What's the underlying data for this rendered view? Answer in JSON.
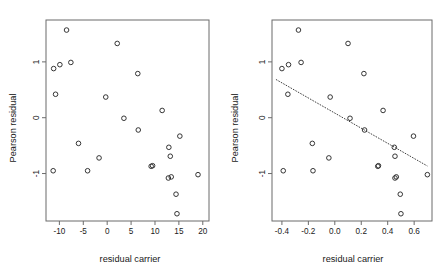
{
  "figure": {
    "background": "#ffffff",
    "point_color": "#2b2b2b",
    "frame_color": "#6b6b6b",
    "panel_count": 2
  },
  "chart_data": [
    {
      "type": "scatter",
      "panel": "left",
      "title": "",
      "xlabel": "residual carrier",
      "ylabel": "Pearson residual",
      "xticks": [
        "-10",
        "-5",
        "0",
        "5",
        "10",
        "15",
        "20"
      ],
      "xtick_values": [
        -10,
        -5,
        0,
        5,
        10,
        15,
        20
      ],
      "yticks": [
        "1",
        "0",
        "-1"
      ],
      "ytick_values": [
        1,
        0,
        -1
      ],
      "xlim": [
        -12.8,
        21.3
      ],
      "ylim": [
        -1.85,
        1.75
      ],
      "grid": false,
      "legend": "none",
      "marker": "open-circle",
      "points": [
        {
          "x": -11.3,
          "y": -0.95
        },
        {
          "x": -11.2,
          "y": 0.88
        },
        {
          "x": -10.8,
          "y": 0.42
        },
        {
          "x": -9.9,
          "y": 0.95
        },
        {
          "x": -8.5,
          "y": 1.57
        },
        {
          "x": -7.6,
          "y": 0.99
        },
        {
          "x": -6.0,
          "y": -0.46
        },
        {
          "x": -4.1,
          "y": -0.95
        },
        {
          "x": -1.7,
          "y": -0.72
        },
        {
          "x": -0.3,
          "y": 0.37
        },
        {
          "x": 2.1,
          "y": 1.33
        },
        {
          "x": 3.5,
          "y": -0.01
        },
        {
          "x": 6.4,
          "y": 0.79
        },
        {
          "x": 6.5,
          "y": -0.22
        },
        {
          "x": 9.2,
          "y": -0.87
        },
        {
          "x": 9.5,
          "y": -0.86
        },
        {
          "x": 11.5,
          "y": 0.13
        },
        {
          "x": 12.9,
          "y": -0.53
        },
        {
          "x": 12.8,
          "y": -1.08
        },
        {
          "x": 13.4,
          "y": -1.06
        },
        {
          "x": 13.2,
          "y": -0.69
        },
        {
          "x": 14.4,
          "y": -1.37
        },
        {
          "x": 14.6,
          "y": -1.72
        },
        {
          "x": 15.2,
          "y": -0.33
        },
        {
          "x": 19.0,
          "y": -1.02
        }
      ],
      "fit_line": null
    },
    {
      "type": "scatter",
      "panel": "right",
      "title": "",
      "xlabel": "residual carrier",
      "ylabel": "Pearson residual",
      "xticks": [
        "-0.4",
        "-0.2",
        "0.0",
        "0.2",
        "0.4",
        "0.6"
      ],
      "xtick_values": [
        -0.4,
        -0.2,
        0.0,
        0.2,
        0.4,
        0.6
      ],
      "yticks": [
        "1",
        "0",
        "-1"
      ],
      "ytick_values": [
        1,
        0,
        -1
      ],
      "xlim": [
        -0.475,
        0.735
      ],
      "ylim": [
        -1.85,
        1.75
      ],
      "grid": false,
      "legend": "none",
      "marker": "open-circle",
      "points": [
        {
          "x": -0.4,
          "y": 0.88
        },
        {
          "x": -0.39,
          "y": -0.95
        },
        {
          "x": -0.355,
          "y": 0.42
        },
        {
          "x": -0.35,
          "y": 0.95
        },
        {
          "x": -0.275,
          "y": 1.57
        },
        {
          "x": -0.255,
          "y": 0.99
        },
        {
          "x": -0.17,
          "y": -0.46
        },
        {
          "x": -0.165,
          "y": -0.95
        },
        {
          "x": -0.045,
          "y": -0.72
        },
        {
          "x": -0.035,
          "y": 0.37
        },
        {
          "x": 0.1,
          "y": 1.33
        },
        {
          "x": 0.115,
          "y": -0.01
        },
        {
          "x": 0.22,
          "y": 0.79
        },
        {
          "x": 0.225,
          "y": -0.22
        },
        {
          "x": 0.325,
          "y": -0.87
        },
        {
          "x": 0.33,
          "y": -0.86
        },
        {
          "x": 0.365,
          "y": 0.13
        },
        {
          "x": 0.45,
          "y": -0.53
        },
        {
          "x": 0.455,
          "y": -1.08
        },
        {
          "x": 0.465,
          "y": -1.06
        },
        {
          "x": 0.455,
          "y": -0.69
        },
        {
          "x": 0.495,
          "y": -1.37
        },
        {
          "x": 0.5,
          "y": -1.72
        },
        {
          "x": 0.595,
          "y": -0.33
        },
        {
          "x": 0.7,
          "y": -1.02
        }
      ],
      "fit_line": {
        "style": "dotted",
        "x_start": -0.445,
        "y_start": 0.685,
        "x_end": 0.7,
        "y_end": -0.865
      }
    }
  ]
}
